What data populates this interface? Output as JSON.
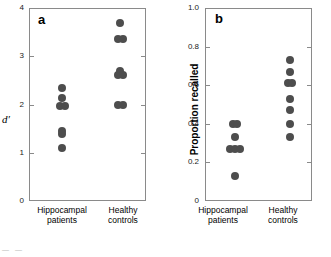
{
  "figure": {
    "caption_fragment": "— —"
  },
  "chart_data": [
    {
      "type": "scatter",
      "panel_letter": "a",
      "title": "",
      "xlabel": "",
      "ylabel": "d′",
      "ylim": [
        0,
        4
      ],
      "yticks": [
        0,
        1,
        2,
        3,
        4
      ],
      "ytick_labels": [
        "0",
        "1",
        "2",
        "3",
        "4"
      ],
      "grid": false,
      "legend": "none",
      "frame": "box",
      "categories": [
        "Hippocampal patients",
        "Healthy controls"
      ],
      "series": [
        {
          "name": "Hippocampal patients",
          "values": [
            2.35,
            2.13,
            1.97,
            1.97,
            1.45,
            1.38,
            1.1
          ]
        },
        {
          "name": "Healthy controls",
          "values": [
            3.68,
            3.35,
            3.35,
            2.7,
            2.62,
            2.62,
            1.98,
            1.98
          ]
        }
      ]
    },
    {
      "type": "scatter",
      "panel_letter": "b",
      "title": "",
      "xlabel": "",
      "ylabel": "Proportion recalled",
      "ylim": [
        0,
        1.0
      ],
      "yticks": [
        0,
        0.2,
        0.4,
        0.6,
        0.8,
        1.0
      ],
      "ytick_labels": [
        "0",
        "0.2",
        "0.4",
        "0.6",
        "0.8",
        "1.0"
      ],
      "grid": false,
      "legend": "none",
      "frame": "box",
      "categories": [
        "Hippocampal patients",
        "Healthy controls"
      ],
      "series": [
        {
          "name": "Hippocampal patients",
          "values": [
            0.4,
            0.4,
            0.33,
            0.27,
            0.27,
            0.27,
            0.13
          ]
        },
        {
          "name": "Healthy controls",
          "values": [
            0.73,
            0.67,
            0.61,
            0.61,
            0.53,
            0.47,
            0.4,
            0.33
          ]
        }
      ]
    }
  ],
  "panel_a": {
    "letter": "a",
    "ylabel": "d′",
    "ytick_labels": [
      "0",
      "1",
      "2",
      "3",
      "4"
    ],
    "group1_line1": "Hippocampal",
    "group1_line2": "patients",
    "group2_line1": "Healthy",
    "group2_line2": "controls"
  },
  "panel_b": {
    "letter": "b",
    "ylabel": "Proportion recalled",
    "ytick_labels": [
      "0",
      "0.2",
      "0.4",
      "0.6",
      "0.8",
      "1.0"
    ],
    "group1_line1": "Hippocampal",
    "group1_line2": "patients",
    "group2_line1": "Healthy",
    "group2_line2": "controls"
  },
  "colors": {
    "dot": "#4d4d4d",
    "axis": "#8a8a8a",
    "text": "#000000"
  }
}
